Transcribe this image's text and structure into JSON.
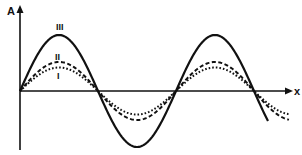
{
  "diagram": {
    "axes": {
      "y_label": "A",
      "x_label": "x"
    },
    "curves": [
      {
        "id": "III",
        "label": "III",
        "style": "solid",
        "relative_amplitude": 1.0
      },
      {
        "id": "II",
        "label": "II",
        "style": "dashed",
        "relative_amplitude": 0.5
      },
      {
        "id": "I",
        "label": "I",
        "style": "dotted",
        "relative_amplitude": 0.4
      }
    ]
  }
}
